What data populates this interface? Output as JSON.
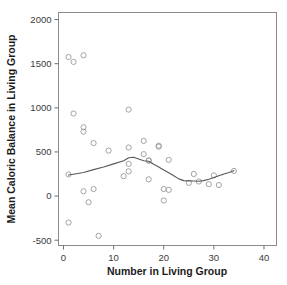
{
  "chart_data": {
    "type": "scatter",
    "title": "",
    "xlabel": "Number in Living Group",
    "ylabel": "Mean Caloric Balance in Living Group",
    "xlim": [
      -1,
      42.5
    ],
    "ylim": [
      -560,
      2080
    ],
    "xticks": [
      0,
      10,
      20,
      30,
      40
    ],
    "xtick_labels": [
      "0",
      "10",
      "20",
      "30",
      "40"
    ],
    "yticks": [
      -500,
      0,
      500,
      1000,
      1500,
      2000
    ],
    "ytick_labels": [
      "-500",
      "0",
      "500",
      "1000",
      "1500",
      "2000"
    ],
    "grid": false,
    "legend": null,
    "marker": "open-circle",
    "marker_color": "#9a9a9a",
    "curve_color": "#595959",
    "points": [
      {
        "x": 1,
        "y": 1575
      },
      {
        "x": 2,
        "y": 1520
      },
      {
        "x": 4,
        "y": 1595
      },
      {
        "x": 2,
        "y": 935
      },
      {
        "x": 4,
        "y": 780
      },
      {
        "x": 4,
        "y": 730
      },
      {
        "x": 6,
        "y": 600
      },
      {
        "x": 9,
        "y": 515
      },
      {
        "x": 13,
        "y": 980
      },
      {
        "x": 13,
        "y": 550
      },
      {
        "x": 16,
        "y": 625
      },
      {
        "x": 19,
        "y": 560
      },
      {
        "x": 19,
        "y": 570
      },
      {
        "x": 16,
        "y": 475
      },
      {
        "x": 17,
        "y": 405
      },
      {
        "x": 17,
        "y": 400
      },
      {
        "x": 21,
        "y": 410
      },
      {
        "x": 13,
        "y": 365
      },
      {
        "x": 13,
        "y": 280
      },
      {
        "x": 12,
        "y": 225
      },
      {
        "x": 1,
        "y": 245
      },
      {
        "x": 17,
        "y": 190
      },
      {
        "x": 26,
        "y": 250
      },
      {
        "x": 27,
        "y": 165
      },
      {
        "x": 25,
        "y": 150
      },
      {
        "x": 30,
        "y": 235
      },
      {
        "x": 29,
        "y": 135
      },
      {
        "x": 31,
        "y": 125
      },
      {
        "x": 34,
        "y": 285
      },
      {
        "x": 4,
        "y": 55
      },
      {
        "x": 6,
        "y": 80
      },
      {
        "x": 5,
        "y": -70
      },
      {
        "x": 20,
        "y": 80
      },
      {
        "x": 21,
        "y": 70
      },
      {
        "x": 20,
        "y": -50
      },
      {
        "x": 1,
        "y": -300
      },
      {
        "x": 7,
        "y": -450
      }
    ],
    "smooth_line": [
      {
        "x": 1,
        "y": 238
      },
      {
        "x": 2,
        "y": 248
      },
      {
        "x": 4,
        "y": 268
      },
      {
        "x": 6,
        "y": 300
      },
      {
        "x": 8,
        "y": 330
      },
      {
        "x": 10,
        "y": 365
      },
      {
        "x": 12,
        "y": 400
      },
      {
        "x": 13,
        "y": 435
      },
      {
        "x": 14,
        "y": 440
      },
      {
        "x": 15,
        "y": 420
      },
      {
        "x": 16,
        "y": 400
      },
      {
        "x": 17,
        "y": 395
      },
      {
        "x": 18,
        "y": 360
      },
      {
        "x": 19,
        "y": 330
      },
      {
        "x": 20,
        "y": 295
      },
      {
        "x": 21,
        "y": 265
      },
      {
        "x": 22,
        "y": 230
      },
      {
        "x": 23,
        "y": 195
      },
      {
        "x": 24,
        "y": 175
      },
      {
        "x": 25,
        "y": 172
      },
      {
        "x": 26,
        "y": 170
      },
      {
        "x": 27,
        "y": 168
      },
      {
        "x": 28,
        "y": 175
      },
      {
        "x": 29,
        "y": 190
      },
      {
        "x": 30,
        "y": 210
      },
      {
        "x": 31,
        "y": 230
      },
      {
        "x": 32,
        "y": 250
      },
      {
        "x": 33,
        "y": 268
      },
      {
        "x": 34,
        "y": 288
      }
    ]
  }
}
